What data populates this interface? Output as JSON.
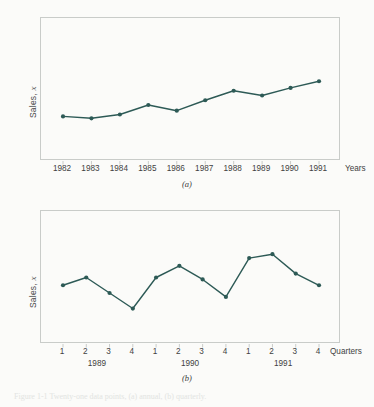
{
  "figure": {
    "background_color": "#fbfbf9",
    "line_color": "#2d5a56",
    "frame_color": "#c9ccc9",
    "caption_faint": "Figure 1-1   Twenty-one data points, (a) annual, (b) quarterly."
  },
  "chart_a": {
    "subcaption": "(a)",
    "ylabel_text": "Sales, ",
    "ylabel_symbol": "x",
    "xaxis_title": "Years"
  },
  "chart_b": {
    "subcaption": "(b)",
    "ylabel_text": "Sales, ",
    "ylabel_symbol": "x",
    "xaxis_title": "Quarters",
    "group_labels": [
      "1989",
      "1990",
      "1991"
    ]
  },
  "chart_data": [
    {
      "type": "line",
      "id": "a",
      "title": "",
      "xlabel": "Years",
      "ylabel": "Sales, x",
      "categories": [
        "1982",
        "1983",
        "1984",
        "1985",
        "1986",
        "1987",
        "1988",
        "1989",
        "1990",
        "1991"
      ],
      "values": [
        28,
        26,
        30,
        40,
        34,
        45,
        55,
        50,
        58,
        65
      ],
      "ylim": [
        0,
        100
      ],
      "grid": false,
      "legend": false,
      "marker": "circle",
      "annotations": [
        "(a)"
      ]
    },
    {
      "type": "line",
      "id": "b",
      "title": "",
      "xlabel": "Quarters",
      "ylabel": "Sales, x",
      "categories": [
        "1",
        "2",
        "3",
        "4",
        "1",
        "2",
        "3",
        "4",
        "1",
        "2",
        "3",
        "4"
      ],
      "groups": [
        {
          "label": "1989",
          "categories": [
            "1",
            "2",
            "3",
            "4"
          ]
        },
        {
          "label": "1990",
          "categories": [
            "1",
            "2",
            "3",
            "4"
          ]
        },
        {
          "label": "1991",
          "categories": [
            "1",
            "2",
            "3",
            "4"
          ]
        }
      ],
      "values": [
        42,
        50,
        34,
        18,
        50,
        62,
        48,
        30,
        70,
        74,
        54,
        42
      ],
      "ylim": [
        0,
        100
      ],
      "grid": false,
      "legend": false,
      "marker": "circle",
      "annotations": [
        "(b)"
      ]
    }
  ]
}
